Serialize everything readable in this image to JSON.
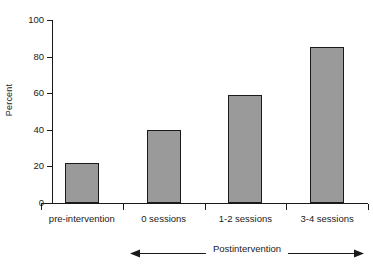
{
  "chart_data": {
    "type": "bar",
    "title": "",
    "subtitle": "",
    "xlabel": "",
    "ylabel": "Percent",
    "categories": [
      "pre-intervention",
      "0 sessions",
      "1-2 sessions",
      "3-4 sessions"
    ],
    "values": [
      22,
      40,
      59,
      85
    ],
    "ylim": [
      0,
      100
    ],
    "yticks": [
      "0",
      "20",
      "40",
      "60",
      "80",
      "100"
    ],
    "ytick_values": [
      0,
      20,
      40,
      60,
      80,
      100
    ],
    "grid": false,
    "legend": false,
    "bar_fill_color": "#9a9a9a",
    "bar_edge_color": "#1a1a1a",
    "axis_color": "#1a1a1a",
    "background_color": "#ffffff",
    "annotations": [
      {
        "text": "Postintervention",
        "type": "double-headed-arrow",
        "spans_categories": [
          "0 sessions",
          "1-2 sessions",
          "3-4 sessions"
        ]
      }
    ]
  },
  "axis": {
    "y_title": "Percent",
    "ticks": [
      {
        "label": "100",
        "value": 100
      },
      {
        "label": "80",
        "value": 80
      },
      {
        "label": "60",
        "value": 60
      },
      {
        "label": "40",
        "value": 40
      },
      {
        "label": "20",
        "value": 20
      },
      {
        "label": "0",
        "value": 0
      }
    ]
  },
  "bars": [
    {
      "label": "pre-intervention",
      "value": 22
    },
    {
      "label": "0 sessions",
      "value": 40
    },
    {
      "label": "1-2 sessions",
      "value": 59
    },
    {
      "label": "3-4 sessions",
      "value": 85
    }
  ],
  "annotation": {
    "label": "Postintervention"
  }
}
